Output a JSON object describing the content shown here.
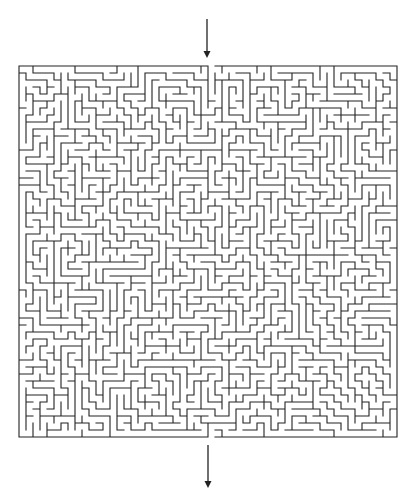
{
  "title": "Maze",
  "puzzle": {
    "type": "rectangular-maze",
    "columns": 54,
    "rows": 53,
    "cell_size_px": 7,
    "origin": {
      "x": 19,
      "y": 66
    },
    "wall_color": "#222222",
    "wall_width": 1.1,
    "background": "#ffffff",
    "seed": 9137,
    "entrance": {
      "side": "top",
      "column": 27
    },
    "exit": {
      "side": "bottom",
      "column": 27
    }
  },
  "arrows": {
    "start": {
      "x": 207,
      "y1": 19,
      "y2": 58,
      "direction": "down",
      "color": "#222222"
    },
    "finish": {
      "x": 208,
      "y1": 445,
      "y2": 488,
      "direction": "down",
      "color": "#222222"
    }
  }
}
